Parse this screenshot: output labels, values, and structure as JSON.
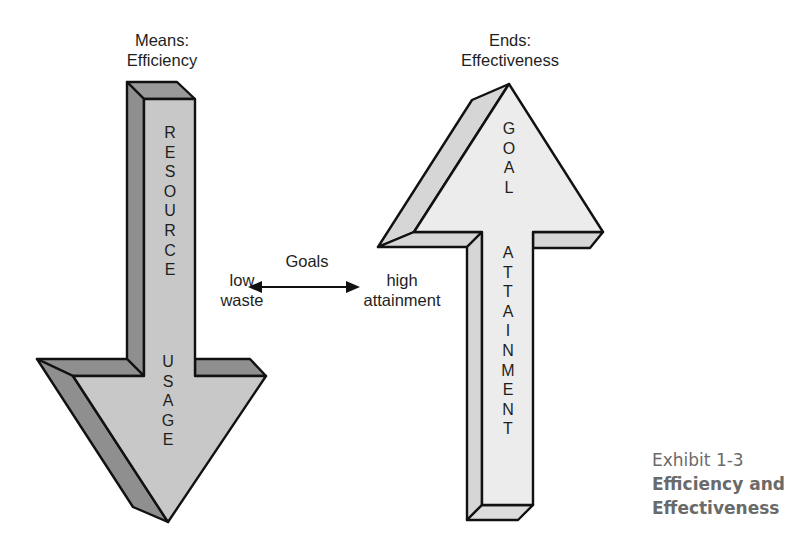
{
  "left_arrow": {
    "header_line1": "Means:",
    "header_line2": "Efficiency",
    "shaft_letters": [
      "R",
      "E",
      "S",
      "O",
      "U",
      "R",
      "C",
      "E"
    ],
    "head_letters": [
      "U",
      "S",
      "A",
      "G",
      "E"
    ],
    "direction": "down",
    "colors": {
      "front": "#c8c8c8",
      "side": "#8f8f8f",
      "top": "#9a9a9a"
    }
  },
  "right_arrow": {
    "header_line1": "Ends:",
    "header_line2": "Effectiveness",
    "head_letters": [
      "G",
      "O",
      "A",
      "L"
    ],
    "shaft_letters": [
      "A",
      "T",
      "T",
      "A",
      "I",
      "N",
      "M",
      "E",
      "N",
      "T"
    ],
    "direction": "up",
    "colors": {
      "front": "#ececec",
      "side": "#d6d6d6"
    }
  },
  "center": {
    "goals_label": "Goals",
    "left_line1": "low",
    "left_line2": "waste",
    "right_line1": "high",
    "right_line2": "attainment"
  },
  "caption": {
    "exhibit_number": "Exhibit 1-3",
    "title_line1": "Efficiency and",
    "title_line2": "Effectiveness"
  }
}
